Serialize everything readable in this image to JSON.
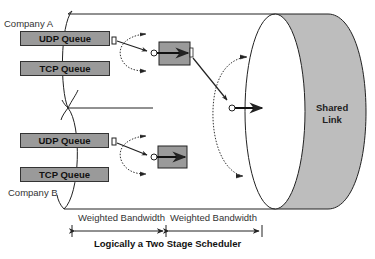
{
  "diagram": {
    "title": "Logically a Two Stage Scheduler",
    "shared_link": {
      "line1": "Shared",
      "line2": "Link",
      "fill": "#bdbdbd"
    },
    "companies": [
      {
        "label": "Company A",
        "queues": [
          {
            "label": "UDP Queue"
          },
          {
            "label": "TCP Queue"
          }
        ]
      },
      {
        "label": "Company B",
        "queues": [
          {
            "label": "UDP Queue"
          },
          {
            "label": "TCP Queue"
          }
        ]
      }
    ],
    "bandwidth_labels": [
      "Weighted Bandwidth",
      "Weighted Bandwidth"
    ],
    "colors": {
      "queue_fill": "#9a9a9a",
      "stroke": "#222222",
      "link_fill": "#bdbdbd"
    }
  }
}
